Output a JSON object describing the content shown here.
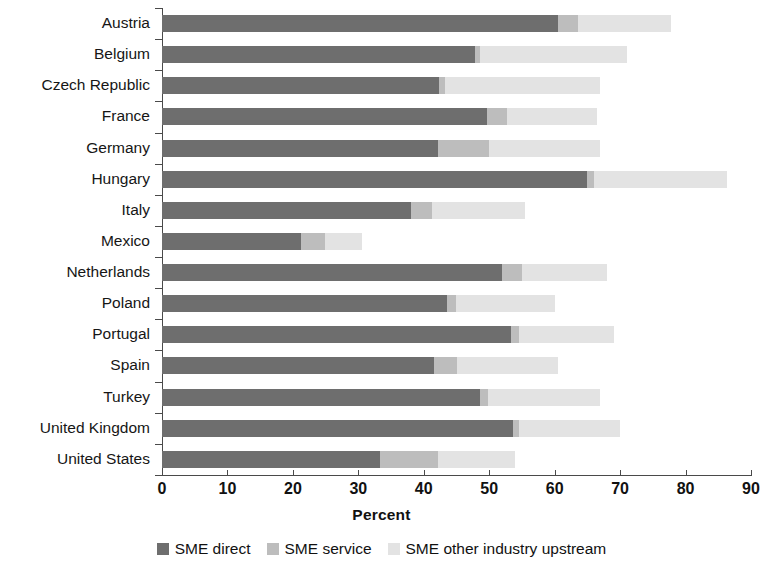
{
  "chart_data": {
    "type": "bar",
    "orientation": "horizontal",
    "stacked": true,
    "title": "",
    "xlabel": "Percent",
    "ylabel": "",
    "xlim": [
      0,
      90
    ],
    "xticks": [
      0,
      10,
      20,
      30,
      40,
      50,
      60,
      70,
      80,
      90
    ],
    "grid": false,
    "legend_position": "bottom",
    "categories": [
      "Austria",
      "Belgium",
      "Czech Republic",
      "France",
      "Germany",
      "Hungary",
      "Italy",
      "Mexico",
      "Netherlands",
      "Poland",
      "Portugal",
      "Spain",
      "Turkey",
      "United Kingdom",
      "United States"
    ],
    "series": [
      {
        "name": "SME direct",
        "color": "#6e6e6e",
        "values": [
          60.5,
          47.8,
          42.3,
          49.7,
          42.2,
          65.0,
          38.0,
          21.3,
          52.0,
          43.5,
          53.3,
          41.6,
          48.6,
          53.6,
          33.3
        ]
      },
      {
        "name": "SME service",
        "color": "#bdbdbd",
        "values": [
          3.0,
          0.8,
          1.0,
          3.0,
          7.8,
          1.0,
          3.3,
          3.6,
          3.0,
          1.5,
          1.2,
          3.5,
          1.2,
          1.0,
          8.8
        ]
      },
      {
        "name": "SME other industry upstream",
        "color": "#e3e3e3",
        "values": [
          14.3,
          22.4,
          23.7,
          13.8,
          17.0,
          20.4,
          14.2,
          5.7,
          13.0,
          15.0,
          14.5,
          15.4,
          17.2,
          15.4,
          11.9
        ]
      }
    ],
    "totals": [
      77.8,
      71.0,
      67.0,
      66.5,
      67.0,
      86.4,
      55.5,
      30.6,
      68.0,
      60.0,
      69.0,
      60.5,
      67.0,
      70.0,
      54.0
    ]
  },
  "axis": {
    "x_title": "Percent",
    "tick_labels": [
      "0",
      "10",
      "20",
      "30",
      "40",
      "50",
      "60",
      "70",
      "80",
      "90"
    ]
  },
  "legend": {
    "items": [
      {
        "label": "SME direct",
        "color": "#6e6e6e",
        "swatch": "square-swatch"
      },
      {
        "label": "SME service",
        "color": "#bdbdbd",
        "swatch": "square-swatch"
      },
      {
        "label": "SME other industry upstream",
        "color": "#e3e3e3",
        "swatch": "square-swatch"
      }
    ]
  }
}
